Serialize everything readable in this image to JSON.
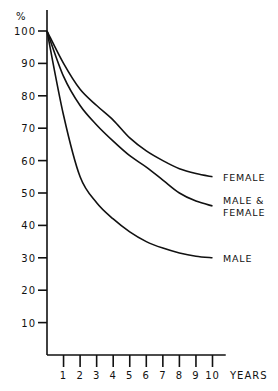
{
  "chart_data": {
    "type": "line",
    "title": "",
    "xlabel": "YEARS",
    "ylabel": "%",
    "x": [
      0,
      1,
      2,
      3,
      4,
      5,
      6,
      7,
      8,
      9,
      10
    ],
    "xticks": [
      "1",
      "2",
      "3",
      "4",
      "5",
      "6",
      "7",
      "8",
      "9",
      "10"
    ],
    "yticks": [
      "10",
      "20",
      "30",
      "40",
      "50",
      "60",
      "70",
      "80",
      "90",
      "100"
    ],
    "xlim": [
      0,
      10.8
    ],
    "ylim": [
      0,
      100
    ],
    "grid": false,
    "legend": "inline labels at right end of each curve",
    "series": [
      {
        "name": "FEMALE",
        "label_lines": [
          "FEMALE"
        ],
        "values": [
          100,
          90,
          82,
          77,
          72.5,
          67,
          63,
          60,
          57.5,
          56,
          55
        ]
      },
      {
        "name": "MALE & FEMALE",
        "label_lines": [
          "MALE &",
          "FEMALE"
        ],
        "values": [
          100,
          86,
          77,
          71,
          66,
          61.5,
          58,
          54,
          50,
          47.5,
          46
        ]
      },
      {
        "name": "MALE",
        "label_lines": [
          "MALE"
        ],
        "values": [
          100,
          74,
          55,
          47,
          42,
          38,
          35,
          33,
          31.5,
          30.5,
          30
        ]
      }
    ]
  }
}
